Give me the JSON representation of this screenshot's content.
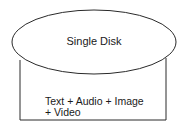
{
  "diagram": {
    "disk": {
      "label": "Single Disk"
    },
    "contents": {
      "line1": "Text + Audio + Image",
      "line2": "+ Video"
    },
    "colors": {
      "stroke": "#2a2a2a",
      "background": "#ffffff"
    }
  }
}
